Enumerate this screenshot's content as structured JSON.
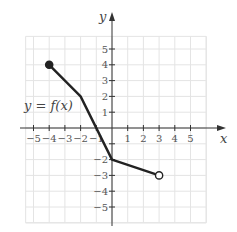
{
  "chart_data": {
    "type": "line",
    "title": "",
    "xlabel": "x",
    "ylabel": "y",
    "function_label": "y = f(x)",
    "xlim": [
      -5.5,
      6
    ],
    "ylim": [
      -6,
      5.8
    ],
    "grid": true,
    "x_ticks": [
      -5,
      -4,
      -3,
      -2,
      -1,
      1,
      2,
      3,
      4,
      5
    ],
    "y_ticks": [
      -5,
      -4,
      -3,
      -2,
      -1,
      1,
      2,
      3,
      4,
      5
    ],
    "x_tick_labels": [
      "−5",
      "−4",
      "−3",
      "−2",
      "−1",
      "1",
      "2",
      "3",
      "4",
      "5"
    ],
    "y_tick_labels": [
      "−5",
      "−4",
      "−3",
      "−2",
      "1",
      "2",
      "3",
      "4",
      "5"
    ],
    "y_tick_label_values": [
      -5,
      -4,
      -3,
      -2,
      1,
      2,
      3,
      4,
      5
    ],
    "series": [
      {
        "name": "f(x)",
        "points": [
          [
            -4,
            4
          ],
          [
            -2,
            2
          ],
          [
            0,
            -2
          ],
          [
            3,
            -3
          ]
        ],
        "start_endpoint": "closed",
        "end_endpoint": "open",
        "color": "#222222"
      }
    ]
  }
}
